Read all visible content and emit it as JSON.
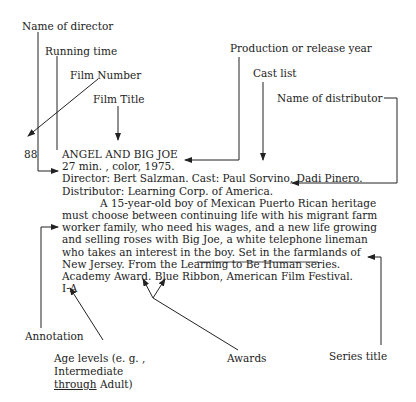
{
  "labels": {
    "director": "Name of director",
    "running_time": "Running time",
    "film_number": "Film Number",
    "film_title": "Film Title",
    "year": "Production or release year",
    "cast": "Cast list",
    "distributor": "Name of distributor",
    "annotation": "Annotation",
    "age_levels_1": "Age levels (e. g. ,",
    "age_levels_2": "Intermediate",
    "age_levels_3a": "through",
    "age_levels_3b": " Adult)",
    "awards": "Awards",
    "series_title": "Series title"
  },
  "entry": {
    "number": "88",
    "title": "ANGEL AND BIG JOE",
    "line2": "27 min. ,  color,  1975.",
    "line3": "Director:  Bert Salzman.   Cast:  Paul Sorvino, Dadi Pinero.",
    "line4": "Distributor:  Learning Corp.  of America.",
    "annotation_lines": [
      "A 15-year-old boy of Mexican Puerto Rican heritage",
      "must choose between continuing life with his migrant farm",
      "worker family,  who need his wages,  and a new life growing",
      "and selling roses with Big Joe,  a white telephone lineman",
      "who takes an interest in the boy.   Set in the farmlands of"
    ],
    "series_prefix": "New Jersey.   From the ",
    "series_name": "Learning to Be Human",
    "series_suffix": " series.",
    "awards_line": "Academy Award.   Blue Ribbon,  American Film Festival.",
    "age_level": "I-A"
  }
}
